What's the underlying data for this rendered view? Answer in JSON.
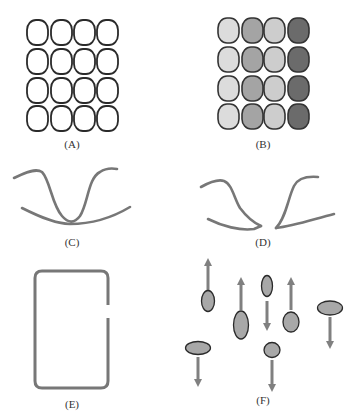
{
  "panels": {
    "A": {
      "label": "(A)",
      "description": "4x4 grid of unfilled rounded cells"
    },
    "B": {
      "label": "(B)",
      "description": "4x4 grid of cells shaded by column"
    },
    "C": {
      "label": "(C)",
      "description": "two intersecting curves"
    },
    "D": {
      "label": "(D)",
      "description": "two non-intersecting curves with a gap"
    },
    "E": {
      "label": "(E)",
      "description": "rounded rectangle outline with a gap on the right side"
    },
    "F": {
      "label": "(F)",
      "description": "ellipses with up/down motion arrows"
    }
  },
  "colors": {
    "outline": "#2a2a2a",
    "curve": "#777777",
    "arrow": "#808080",
    "ellipse_fill": "#a8a8a8",
    "shade_light": "#dcdcdc",
    "shade_medium": "#a4a4a4",
    "shade_light_medium": "#cdcdcd",
    "shade_dark": "#6b6b6b"
  },
  "gridB_column_shades": [
    "light",
    "medium",
    "light-medium",
    "dark"
  ],
  "panelF_items": [
    {
      "shape": "vertical-ellipse",
      "arrow": "up"
    },
    {
      "shape": "large-vertical-ellipse",
      "arrow": "up"
    },
    {
      "shape": "vertical-ellipse",
      "arrow": "down"
    },
    {
      "shape": "circle",
      "arrow": "up"
    },
    {
      "shape": "horizontal-ellipse",
      "arrow": "down"
    },
    {
      "shape": "horizontal-ellipse",
      "arrow": "down"
    },
    {
      "shape": "circle",
      "arrow": "down"
    }
  ]
}
